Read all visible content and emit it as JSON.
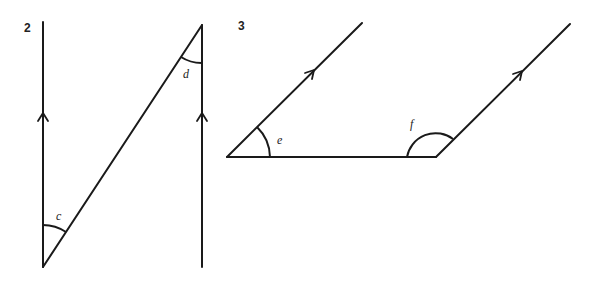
{
  "figures": [
    {
      "number": "2",
      "description": "Two parallel vertical lines (marked with arrows) cut by a transversal",
      "angles": [
        {
          "label": "c",
          "position": "bottom-left, between left vertical line and transversal"
        },
        {
          "label": "d",
          "position": "top-right, between transversal and right vertical line"
        }
      ]
    },
    {
      "number": "3",
      "description": "Two parallel slanted lines (marked with arrows) joined by a horizontal segment",
      "angles": [
        {
          "label": "e",
          "position": "left vertex, between horizontal segment and slanted line"
        },
        {
          "label": "f",
          "position": "right vertex, obtuse angle above horizontal segment"
        }
      ]
    }
  ],
  "colors": {
    "stroke": "#1a1a1a",
    "background": "#ffffff"
  }
}
